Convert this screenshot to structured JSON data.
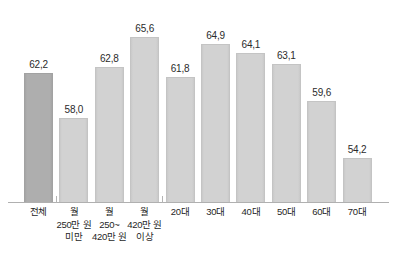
{
  "chart_data": {
    "type": "bar",
    "title": "",
    "subtitle": "",
    "xlabel": "",
    "ylabel": "",
    "ylim": [
      50.0,
      67.0
    ],
    "grid": false,
    "legend": "none",
    "decimal_separator": ",",
    "categories": [
      "전체",
      "월\n250만 원\n미만",
      "월\n250~\n420만 원",
      "월\n420만 원\n이상",
      "20대",
      "30대",
      "40대",
      "50대",
      "60대",
      "70대"
    ],
    "values": [
      62.2,
      58.0,
      62.8,
      65.6,
      61.8,
      64.9,
      64.1,
      63.1,
      59.6,
      54.2
    ],
    "value_labels": [
      "62,2",
      "58,0",
      "62,8",
      "65,6",
      "61,8",
      "64,9",
      "64,1",
      "63,1",
      "59,6",
      "54,2"
    ],
    "group_dividers_after": [
      0,
      3
    ],
    "highlight_index": 0,
    "colors": {
      "bar": "#cfcfcf",
      "bar_border": "#c4c4c4",
      "bar_highlight": "#ababab",
      "bar_highlight_border": "#a2a2a2",
      "axis": "#b0b0b0",
      "text": "#1f1f1f",
      "background": "#ffffff"
    }
  }
}
